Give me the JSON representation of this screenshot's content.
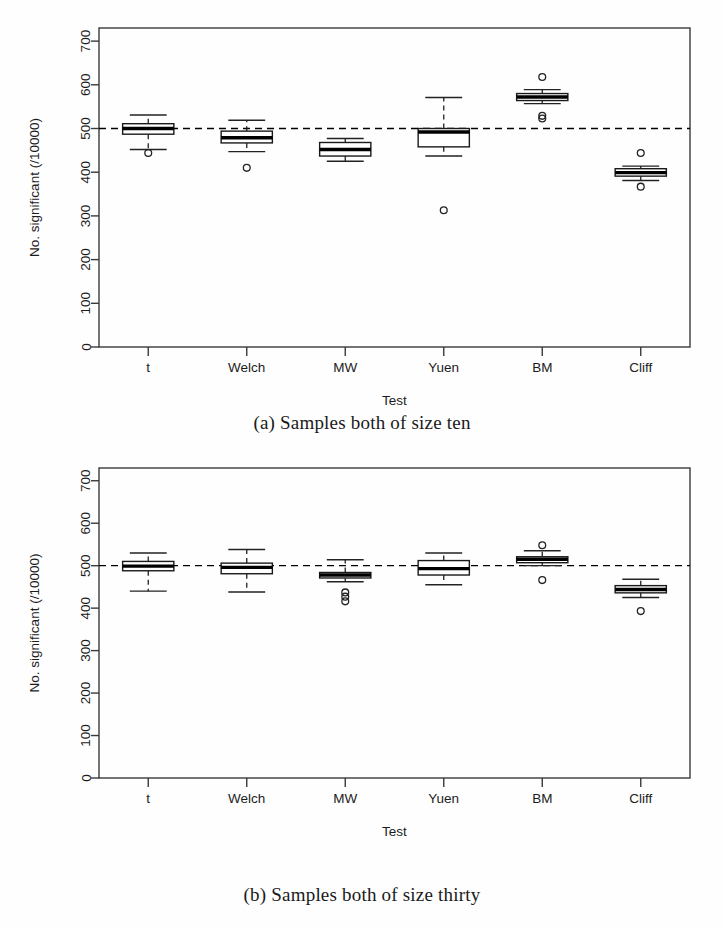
{
  "figure": {
    "panels": [
      {
        "id": "panel-a",
        "caption": "(a) Samples both of size ten",
        "xlabel": "Test",
        "ylabel": "No. significant (/10000)"
      },
      {
        "id": "panel-b",
        "caption": "(b) Samples both of size thirty",
        "xlabel": "Test",
        "ylabel": "No. significant (/10000)"
      }
    ]
  },
  "chart_data": [
    {
      "type": "box",
      "title": "(a) Samples both of size ten",
      "xlabel": "Test",
      "ylabel": "No. significant (/10000)",
      "categories": [
        "t",
        "Welch",
        "MW",
        "Yuen",
        "BM",
        "Cliff"
      ],
      "ytick_labels": [
        "0",
        "100",
        "200",
        "300",
        "400",
        "500",
        "600",
        "700"
      ],
      "yticks": [
        0,
        100,
        200,
        300,
        400,
        500,
        600,
        700
      ],
      "ylim": [
        0,
        730
      ],
      "grid": false,
      "legend": false,
      "reference_line": {
        "value": 500,
        "style": "dashed",
        "color": "#000000"
      },
      "boxes": [
        {
          "category": "t",
          "whisker_low": 452,
          "q1": 487,
          "median": 500,
          "q3": 511,
          "whisker_high": 531,
          "outliers": [
            444
          ]
        },
        {
          "category": "Welch",
          "whisker_low": 447,
          "q1": 467,
          "median": 479,
          "q3": 494,
          "whisker_high": 519,
          "outliers": [
            410
          ]
        },
        {
          "category": "MW",
          "whisker_low": 425,
          "q1": 437,
          "median": 452,
          "q3": 468,
          "whisker_high": 477,
          "outliers": []
        },
        {
          "category": "Yuen",
          "whisker_low": 437,
          "q1": 458,
          "median": 492,
          "q3": 500,
          "whisker_high": 571,
          "outliers": [
            313
          ]
        },
        {
          "category": "BM",
          "whisker_low": 557,
          "q1": 564,
          "median": 572,
          "q3": 580,
          "whisker_high": 589,
          "outliers": [
            618,
            529,
            523
          ]
        },
        {
          "category": "Cliff",
          "whisker_low": 381,
          "q1": 391,
          "median": 399,
          "q3": 408,
          "whisker_high": 414,
          "outliers": [
            444,
            367
          ]
        }
      ]
    },
    {
      "type": "box",
      "title": "(b) Samples both of size thirty",
      "xlabel": "Test",
      "ylabel": "No. significant (/10000)",
      "categories": [
        "t",
        "Welch",
        "MW",
        "Yuen",
        "BM",
        "Cliff"
      ],
      "ytick_labels": [
        "0",
        "100",
        "200",
        "300",
        "400",
        "500",
        "600",
        "700"
      ],
      "yticks": [
        0,
        100,
        200,
        300,
        400,
        500,
        600,
        700
      ],
      "ylim": [
        0,
        730
      ],
      "grid": false,
      "legend": false,
      "reference_line": {
        "value": 500,
        "style": "dashed",
        "color": "#000000"
      },
      "boxes": [
        {
          "category": "t",
          "whisker_low": 440,
          "q1": 488,
          "median": 499,
          "q3": 510,
          "whisker_high": 530,
          "outliers": []
        },
        {
          "category": "Welch",
          "whisker_low": 438,
          "q1": 481,
          "median": 496,
          "q3": 506,
          "whisker_high": 538,
          "outliers": []
        },
        {
          "category": "MW",
          "whisker_low": 462,
          "q1": 471,
          "median": 478,
          "q3": 484,
          "whisker_high": 514,
          "outliers": [
            437,
            427,
            416
          ]
        },
        {
          "category": "Yuen",
          "whisker_low": 455,
          "q1": 478,
          "median": 493,
          "q3": 512,
          "whisker_high": 530,
          "outliers": []
        },
        {
          "category": "BM",
          "whisker_low": 500,
          "q1": 507,
          "median": 515,
          "q3": 521,
          "whisker_high": 535,
          "outliers": [
            548,
            466
          ]
        },
        {
          "category": "Cliff",
          "whisker_low": 425,
          "q1": 436,
          "median": 444,
          "q3": 453,
          "whisker_high": 468,
          "outliers": [
            393
          ]
        }
      ]
    }
  ]
}
